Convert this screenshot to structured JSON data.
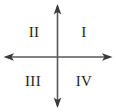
{
  "figure": {
    "background_color": "#ffffff",
    "stroke_color": "#58595b",
    "text_color": "#231f20"
  },
  "axes": {
    "origin_x": 57.5,
    "origin_y": 57,
    "vertical": {
      "name": "vertical-axis",
      "x": 57.5,
      "top_y": 5,
      "bottom_y": 107,
      "arrow_top": true,
      "arrow_bottom": true
    },
    "horizontal": {
      "name": "horizontal-axis",
      "y": 57,
      "left_x": 5,
      "right_x": 111,
      "arrow_left": true,
      "arrow_right": true
    }
  },
  "quadrants": [
    {
      "id": "q1",
      "label": "I",
      "x": 84,
      "y": 32
    },
    {
      "id": "q2",
      "label": "II",
      "x": 34,
      "y": 32
    },
    {
      "id": "q3",
      "label": "III",
      "x": 33,
      "y": 81
    },
    {
      "id": "q4",
      "label": "IV",
      "x": 84,
      "y": 81
    }
  ]
}
